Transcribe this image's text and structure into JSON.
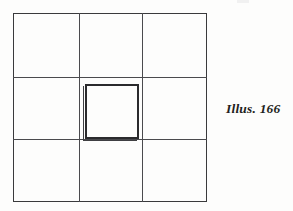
{
  "figure": {
    "caption": "Illus. 166",
    "background_color": "#fdfdfc",
    "line_color": "#3a3a3c",
    "heavy_line_color": "#2b2b2d"
  },
  "diagram": {
    "type": "grid-with-inset-square",
    "grid": {
      "rows": 3,
      "columns": 3,
      "cells": [
        {
          "row": 1,
          "column": 1,
          "label": ""
        },
        {
          "row": 1,
          "column": 2,
          "label": ""
        },
        {
          "row": 1,
          "column": 3,
          "label": ""
        },
        {
          "row": 2,
          "column": 1,
          "label": ""
        },
        {
          "row": 2,
          "column": 2,
          "label": ""
        },
        {
          "row": 2,
          "column": 3,
          "label": ""
        },
        {
          "row": 3,
          "column": 1,
          "label": ""
        },
        {
          "row": 3,
          "column": 2,
          "label": ""
        },
        {
          "row": 3,
          "column": 3,
          "label": ""
        }
      ]
    },
    "inset_square": {
      "placement": "center-cell",
      "stroke": "heavy-double",
      "label": ""
    }
  }
}
